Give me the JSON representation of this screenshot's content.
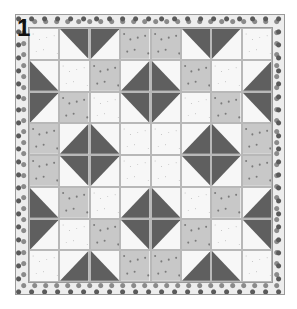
{
  "block_label": "1",
  "colors": {
    "light": "#f7f7f7",
    "medium": "#c8c8c8",
    "dark": "#5f5f5f",
    "border_bg": "#ededed",
    "grid_line": "#9a9a9a"
  },
  "legend": {
    "L": "light speckled fabric",
    "M": "medium gray dotted fabric",
    "D": "dark gray floral fabric",
    "HST": "half-square triangle: [corner color pair, diagonal direction]"
  },
  "grid_size": 8,
  "cells": [
    [
      "L",
      "D/L-tr",
      "D/L-tl",
      "M",
      "M",
      "D/L-tr",
      "D/L-tl",
      "L"
    ],
    [
      "D/L-bl",
      "L",
      "M",
      "D/L-br",
      "D/L-bl",
      "M",
      "L",
      "D/L-br"
    ],
    [
      "D/L-tl",
      "M",
      "L",
      "D/L-tr",
      "D/L-tl",
      "L",
      "M",
      "D/L-tr"
    ],
    [
      "M",
      "D/L-br",
      "D/L-bl",
      "L",
      "L",
      "D/L-br",
      "D/L-bl",
      "M"
    ],
    [
      "M",
      "D/L-tr",
      "D/L-tl",
      "L",
      "L",
      "D/L-tr",
      "D/L-tl",
      "M"
    ],
    [
      "D/L-bl",
      "M",
      "L",
      "D/L-br",
      "D/L-bl",
      "L",
      "M",
      "D/L-br"
    ],
    [
      "D/L-tl",
      "L",
      "M",
      "D/L-tr",
      "D/L-tl",
      "M",
      "L",
      "D/L-tr"
    ],
    [
      "L",
      "D/L-br",
      "D/L-bl",
      "M",
      "M",
      "D/L-br",
      "D/L-bl",
      "L"
    ]
  ]
}
